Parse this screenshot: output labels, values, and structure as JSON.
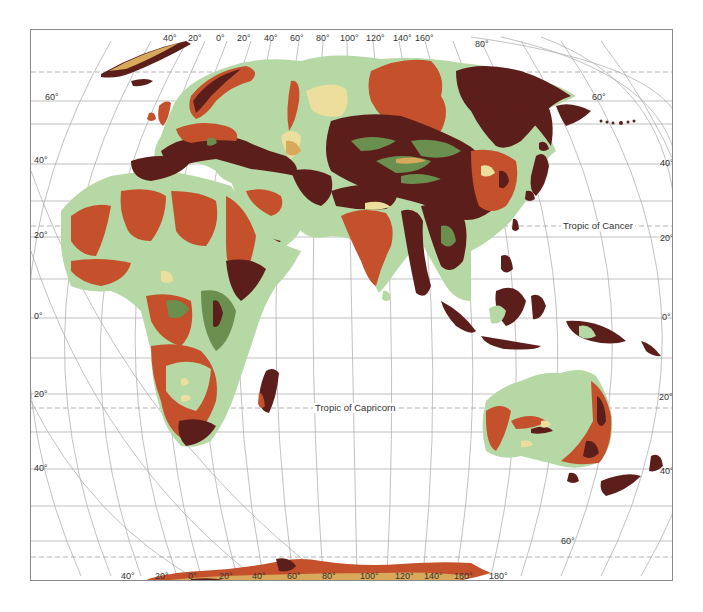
{
  "map": {
    "type": "physical relief map, Eastern Hemisphere projection",
    "colors": {
      "lowland_green": "#b5d8a4",
      "mid_green": "#6a8f4e",
      "plateau_yellow": "#ecdf9e",
      "upland_orange": "#c4512b",
      "mountain_maroon": "#5c1e1a",
      "ice_ochre": "#d8a95a",
      "graticule": "#9a9a9a",
      "frame": "#8a8a8a"
    },
    "top_longitude_labels": [
      "40°",
      "20°",
      "0°",
      "20°",
      "40°",
      "60°",
      "80°",
      "100°",
      "120°",
      "140°",
      "160°"
    ],
    "top_right_latitude_label": "80°",
    "bottom_longitude_labels": [
      "40°",
      "20°",
      "0°",
      "20°",
      "40°",
      "60°",
      "80°",
      "100°",
      "120°",
      "140°",
      "160°",
      "180°"
    ],
    "left_latitude_labels": [
      "60°",
      "40°",
      "20°",
      "0°",
      "20°",
      "40°"
    ],
    "right_latitude_labels": [
      "60°",
      "40°",
      "20°",
      "0°",
      "20°",
      "40°"
    ],
    "bottom_right_latitude_label": "60°",
    "annotations": {
      "tropic_cancer": "Tropic of Cancer",
      "tropic_capricorn": "Tropic of Capricorn"
    }
  }
}
